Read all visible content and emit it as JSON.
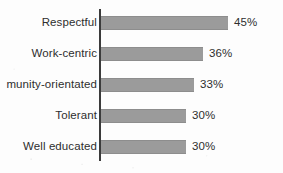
{
  "chart_data": {
    "type": "bar",
    "orientation": "horizontal",
    "title": "",
    "subtitle": "",
    "xlabel": "",
    "ylabel": "",
    "grid": false,
    "legend": null,
    "xlim": [
      0,
      45
    ],
    "value_suffix": "%",
    "categories": [
      "Respectful",
      "Work-centric",
      "munity-orientated",
      "Tolerant",
      "Well educated"
    ],
    "values": [
      45,
      36,
      33,
      30,
      30
    ],
    "value_labels": [
      "45%",
      "36%",
      "33%",
      "30%",
      "30%"
    ],
    "colors": {
      "bar_fill": "#9b9b9b",
      "bar_edge": "#8d8d8d",
      "axis_line": "#3b3b3b",
      "text": "#2e2e2e",
      "background": "#fdfdfd"
    },
    "notes": {
      "clipped_label_index": 2,
      "clipped_label_note": "Third category label is cut off at the left image edge; full word appears to be 'Community-orientated'."
    }
  }
}
